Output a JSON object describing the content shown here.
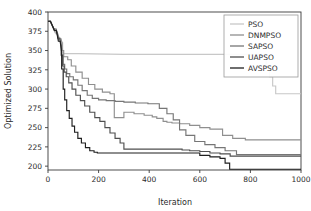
{
  "chart_data": {
    "type": "line",
    "title": "",
    "xlabel": "Iteration",
    "ylabel": "Optimized Solution",
    "xlim": [
      0,
      1000
    ],
    "ylim": [
      195,
      400
    ],
    "xticks": [
      0,
      200,
      400,
      600,
      800,
      1000
    ],
    "yticks": [
      200,
      225,
      250,
      275,
      300,
      325,
      350,
      375,
      400
    ],
    "grid": false,
    "legend_position": "upper right",
    "legend_frame": true,
    "series": [
      {
        "name": "PSO",
        "color": "#c8c8c8",
        "final_value": 294,
        "x": [
          0,
          8,
          30,
          38,
          45,
          52,
          52,
          58,
          58,
          62,
          120,
          300,
          500,
          700,
          855,
          862,
          862,
          875,
          875,
          888,
          888,
          900,
          900,
          1000
        ],
        "y": [
          388,
          388,
          372,
          372,
          365,
          365,
          360,
          360,
          352,
          346,
          346,
          345,
          345,
          345,
          345,
          345,
          330,
          330,
          316,
          316,
          304,
          304,
          294,
          294
        ]
      },
      {
        "name": "DNMPSO",
        "color": "#8f8f8f",
        "final_value": 234,
        "x": [
          0,
          10,
          28,
          36,
          44,
          50,
          56,
          56,
          62,
          62,
          78,
          78,
          92,
          92,
          110,
          110,
          135,
          135,
          160,
          160,
          185,
          185,
          215,
          215,
          245,
          245,
          262,
          262,
          300,
          300,
          340,
          340,
          380,
          380,
          412,
          412,
          430,
          430,
          455,
          455,
          470,
          470,
          490,
          490,
          520,
          520,
          560,
          560,
          600,
          600,
          640,
          640,
          690,
          690,
          730,
          730,
          780,
          780,
          1000
        ],
        "y": [
          388,
          388,
          374,
          374,
          366,
          366,
          360,
          350,
          350,
          342,
          342,
          338,
          338,
          330,
          330,
          322,
          322,
          314,
          314,
          306,
          306,
          300,
          300,
          296,
          296,
          294,
          294,
          263,
          263,
          270,
          270,
          268,
          268,
          266,
          266,
          264,
          264,
          262,
          262,
          258,
          258,
          257,
          257,
          256,
          256,
          255,
          255,
          253,
          253,
          250,
          250,
          248,
          248,
          240,
          240,
          236,
          236,
          234,
          234
        ]
      },
      {
        "name": "SAPSO",
        "color": "#767676",
        "final_value": 215,
        "x": [
          0,
          9,
          26,
          34,
          42,
          48,
          54,
          54,
          60,
          60,
          66,
          66,
          74,
          74,
          86,
          86,
          100,
          100,
          118,
          118,
          135,
          135,
          155,
          155,
          175,
          175,
          200,
          200,
          230,
          230,
          265,
          265,
          300,
          300,
          345,
          345,
          395,
          395,
          440,
          440,
          470,
          470,
          495,
          495,
          520,
          520,
          545,
          545,
          580,
          580,
          620,
          620,
          660,
          660,
          700,
          700,
          745,
          745,
          1000
        ],
        "y": [
          388,
          388,
          376,
          376,
          364,
          364,
          352,
          342,
          342,
          332,
          332,
          326,
          326,
          320,
          320,
          316,
          316,
          312,
          312,
          305,
          305,
          298,
          298,
          292,
          292,
          288,
          288,
          286,
          286,
          285,
          285,
          284,
          284,
          283,
          283,
          282,
          282,
          281,
          281,
          275,
          275,
          268,
          268,
          260,
          260,
          247,
          247,
          240,
          240,
          232,
          232,
          228,
          228,
          224,
          224,
          220,
          220,
          215,
          215
        ]
      },
      {
        "name": "UAPSO",
        "color": "#4f4f4f",
        "final_value": 213,
        "x": [
          0,
          9,
          24,
          32,
          40,
          46,
          52,
          52,
          58,
          58,
          64,
          64,
          72,
          72,
          82,
          82,
          95,
          95,
          110,
          110,
          128,
          128,
          145,
          145,
          165,
          165,
          185,
          185,
          205,
          205,
          225,
          225,
          245,
          245,
          265,
          265,
          285,
          285,
          300,
          300,
          360,
          430,
          500,
          530,
          530,
          560,
          560,
          600,
          600,
          640,
          640,
          680,
          680,
          720,
          720,
          1000
        ],
        "y": [
          388,
          388,
          378,
          378,
          366,
          366,
          356,
          344,
          344,
          330,
          330,
          322,
          322,
          316,
          316,
          308,
          308,
          300,
          300,
          292,
          292,
          285,
          285,
          278,
          278,
          270,
          270,
          263,
          263,
          258,
          258,
          250,
          250,
          243,
          243,
          236,
          236,
          230,
          230,
          222,
          222,
          222,
          222,
          222,
          221,
          221,
          220,
          220,
          219,
          219,
          217,
          217,
          216,
          216,
          213,
          213
        ]
      },
      {
        "name": "AVSPSO",
        "color": "#1f1f1f",
        "final_value": 196,
        "x": [
          0,
          10,
          25,
          33,
          41,
          48,
          54,
          54,
          60,
          60,
          66,
          66,
          74,
          74,
          84,
          84,
          95,
          95,
          105,
          105,
          118,
          118,
          132,
          132,
          148,
          148,
          165,
          165,
          182,
          182,
          195,
          195,
          300,
          420,
          520,
          600,
          600,
          640,
          640,
          680,
          680,
          700,
          700,
          718,
          718,
          1000
        ],
        "y": [
          388,
          388,
          376,
          376,
          362,
          362,
          348,
          326,
          326,
          300,
          300,
          286,
          286,
          272,
          272,
          262,
          262,
          252,
          252,
          244,
          244,
          236,
          236,
          230,
          230,
          224,
          224,
          220,
          220,
          218,
          218,
          217,
          217,
          217,
          217,
          217,
          214,
          214,
          212,
          212,
          210,
          210,
          204,
          204,
          196,
          196
        ]
      }
    ]
  },
  "axes": {
    "xlabel": "Iteration",
    "ylabel": "Optimized Solution",
    "xticklabels": [
      "0",
      "200",
      "400",
      "600",
      "800",
      "1000"
    ],
    "yticklabels": [
      "200",
      "225",
      "250",
      "275",
      "300",
      "325",
      "350",
      "375",
      "400"
    ]
  },
  "legend": {
    "entries": [
      {
        "label": "PSO"
      },
      {
        "label": "DNMPSO"
      },
      {
        "label": "SAPSO"
      },
      {
        "label": "UAPSO"
      },
      {
        "label": "AVSPSO"
      }
    ]
  },
  "style": {
    "axis_color": "#3a3a3a",
    "text_color": "#2b2b2b",
    "background": "#ffffff",
    "legend_border": "#9a9a9a"
  }
}
